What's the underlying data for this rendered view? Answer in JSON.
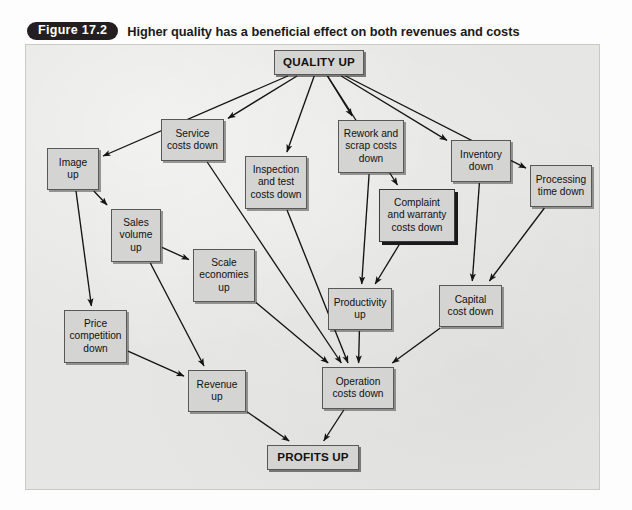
{
  "caption": {
    "badge": "Figure 17.2",
    "text": "Higher quality has a beneficial effect on both revenues and costs"
  },
  "source": {
    "text": "Source: Based on Gummerson, E. (1993).",
    "superscript": "1"
  },
  "colors": {
    "frame_background": "#e6e6e4",
    "node_fill": "#d4d4d2",
    "node_border": "#58585a",
    "badge_background": "#231f20",
    "badge_text": "#ffffff",
    "arrow": "#141414"
  },
  "diagram": {
    "type": "flowchart",
    "nodes": [
      {
        "id": "quality_up",
        "label": "QUALITY UP",
        "x": 248,
        "y": 5,
        "w": 90,
        "h": 25,
        "style": "emphatic"
      },
      {
        "id": "image_up",
        "label": "Image\nup",
        "x": 21,
        "y": 103,
        "w": 52,
        "h": 42,
        "style": "normal"
      },
      {
        "id": "service_costs",
        "label": "Service\ncosts down",
        "x": 135,
        "y": 74,
        "w": 63,
        "h": 42,
        "style": "normal"
      },
      {
        "id": "inspection_test",
        "label": "Inspection\nand test\ncosts down",
        "x": 219,
        "y": 111,
        "w": 62,
        "h": 53,
        "style": "normal"
      },
      {
        "id": "rework_scrap",
        "label": "Rework and\nscrap costs\ndown",
        "x": 312,
        "y": 75,
        "w": 66,
        "h": 53,
        "style": "normal"
      },
      {
        "id": "inventory_down",
        "label": "Inventory\ndown",
        "x": 425,
        "y": 95,
        "w": 60,
        "h": 42,
        "style": "normal"
      },
      {
        "id": "processing_time",
        "label": "Processing\ntime down",
        "x": 504,
        "y": 120,
        "w": 62,
        "h": 42,
        "style": "normal"
      },
      {
        "id": "complaint_warranty",
        "label": "Complaint\nand warranty\ncosts down",
        "x": 353,
        "y": 144,
        "w": 76,
        "h": 53,
        "style": "heavy-shadow"
      },
      {
        "id": "sales_volume",
        "label": "Sales\nvolume\nup",
        "x": 85,
        "y": 164,
        "w": 50,
        "h": 53,
        "style": "normal"
      },
      {
        "id": "scale_economies",
        "label": "Scale\neconomies\nup",
        "x": 167,
        "y": 204,
        "w": 62,
        "h": 53,
        "style": "normal"
      },
      {
        "id": "price_competition",
        "label": "Price\ncompetition\ndown",
        "x": 38,
        "y": 265,
        "w": 63,
        "h": 53,
        "style": "normal"
      },
      {
        "id": "productivity_up",
        "label": "Productivity\nup",
        "x": 302,
        "y": 243,
        "w": 64,
        "h": 42,
        "style": "normal"
      },
      {
        "id": "capital_cost",
        "label": "Capital\ncost down",
        "x": 413,
        "y": 240,
        "w": 63,
        "h": 42,
        "style": "normal"
      },
      {
        "id": "revenue_up",
        "label": "Revenue\nup",
        "x": 162,
        "y": 325,
        "w": 58,
        "h": 42,
        "style": "normal"
      },
      {
        "id": "operation_costs",
        "label": "Operation\ncosts down",
        "x": 296,
        "y": 322,
        "w": 72,
        "h": 42,
        "style": "normal"
      },
      {
        "id": "profits_up",
        "label": "PROFITS UP",
        "x": 241,
        "y": 400,
        "w": 92,
        "h": 25,
        "style": "emphatic"
      }
    ],
    "edges": [
      {
        "from": "quality_up",
        "to": "image_up"
      },
      {
        "from": "quality_up",
        "to": "service_costs"
      },
      {
        "from": "quality_up",
        "to": "inspection_test"
      },
      {
        "from": "quality_up",
        "to": "rework_scrap"
      },
      {
        "from": "quality_up",
        "to": "complaint_warranty"
      },
      {
        "from": "quality_up",
        "to": "inventory_down"
      },
      {
        "from": "quality_up",
        "to": "processing_time"
      },
      {
        "from": "image_up",
        "to": "sales_volume"
      },
      {
        "from": "image_up",
        "to": "price_competition"
      },
      {
        "from": "sales_volume",
        "to": "scale_economies"
      },
      {
        "from": "sales_volume",
        "to": "revenue_up"
      },
      {
        "from": "price_competition",
        "to": "revenue_up"
      },
      {
        "from": "service_costs",
        "to": "operation_costs"
      },
      {
        "from": "inspection_test",
        "to": "operation_costs"
      },
      {
        "from": "scale_economies",
        "to": "operation_costs"
      },
      {
        "from": "rework_scrap",
        "to": "productivity_up"
      },
      {
        "from": "complaint_warranty",
        "to": "productivity_up"
      },
      {
        "from": "inventory_down",
        "to": "capital_cost"
      },
      {
        "from": "processing_time",
        "to": "capital_cost"
      },
      {
        "from": "productivity_up",
        "to": "operation_costs"
      },
      {
        "from": "capital_cost",
        "to": "operation_costs"
      },
      {
        "from": "revenue_up",
        "to": "profits_up"
      },
      {
        "from": "operation_costs",
        "to": "profits_up"
      }
    ]
  }
}
